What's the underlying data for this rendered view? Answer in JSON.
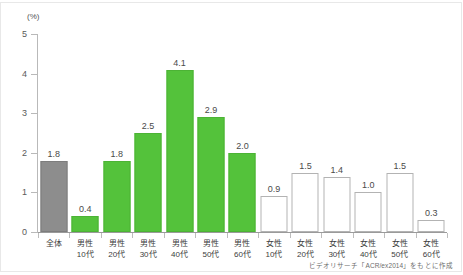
{
  "chart_data": {
    "type": "bar",
    "title": "",
    "subtitle": "",
    "xlabel": "",
    "ylabel": "",
    "unit_label": "(%)",
    "ylim": [
      0,
      5
    ],
    "yticks": [
      0,
      1,
      2,
      3,
      4,
      5
    ],
    "ytick_labels": [
      "0",
      "1",
      "2",
      "3",
      "4",
      "5"
    ],
    "grid": false,
    "legend": null,
    "categories": [
      "全体",
      "男性10代",
      "男性20代",
      "男性30代",
      "男性40代",
      "男性50代",
      "男性60代",
      "女性10代",
      "女性20代",
      "女性30代",
      "女性40代",
      "女性50代",
      "女性60代"
    ],
    "category_lines": [
      {
        "line1": "全体",
        "line2": ""
      },
      {
        "line1": "男性",
        "line2": "10代"
      },
      {
        "line1": "男性",
        "line2": "20代"
      },
      {
        "line1": "男性",
        "line2": "30代"
      },
      {
        "line1": "男性",
        "line2": "40代"
      },
      {
        "line1": "男性",
        "line2": "50代"
      },
      {
        "line1": "男性",
        "line2": "60代"
      },
      {
        "line1": "女性",
        "line2": "10代"
      },
      {
        "line1": "女性",
        "line2": "20代"
      },
      {
        "line1": "女性",
        "line2": "30代"
      },
      {
        "line1": "女性",
        "line2": "40代"
      },
      {
        "line1": "女性",
        "line2": "50代"
      },
      {
        "line1": "女性",
        "line2": "60代"
      }
    ],
    "values": [
      1.8,
      0.4,
      1.8,
      2.5,
      4.1,
      2.9,
      2.0,
      0.9,
      1.5,
      1.4,
      1.0,
      1.5,
      0.3
    ],
    "value_labels": [
      "1.8",
      "0.4",
      "1.8",
      "2.5",
      "4.1",
      "2.9",
      "2.0",
      "0.9",
      "1.5",
      "1.4",
      "1.0",
      "1.5",
      "0.3"
    ],
    "bar_styles": [
      "gray",
      "green",
      "green",
      "green",
      "green",
      "green",
      "green",
      "white",
      "white",
      "white",
      "white",
      "white",
      "white"
    ],
    "colors": {
      "gray": "#8d8d8d",
      "green": "#54c23b",
      "white": "#ffffff",
      "white_border": "#b3b3b3",
      "axis": "#b9b9b9",
      "value_label": "#4a4a4a"
    }
  },
  "source": {
    "note": "ビデオリサーチ「ACR/ex2014」をもとに作成"
  }
}
